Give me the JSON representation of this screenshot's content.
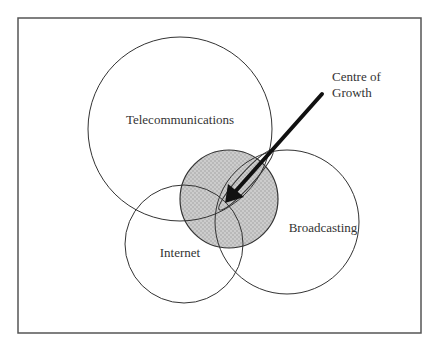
{
  "diagram": {
    "type": "venn",
    "frame": {
      "x": 18,
      "y": 18,
      "width": 403,
      "height": 315,
      "stroke": "#555555"
    },
    "circles": [
      {
        "id": "telecommunications",
        "label": "Telecommunications",
        "cx": 180,
        "cy": 129,
        "r": 92,
        "label_x": 180,
        "label_y": 124
      },
      {
        "id": "internet",
        "label": "Internet",
        "cx": 184,
        "cy": 244,
        "r": 59,
        "label_x": 180,
        "label_y": 257
      },
      {
        "id": "broadcasting",
        "label": "Broadcasting",
        "cx": 287,
        "cy": 222,
        "r": 72,
        "label_x": 323,
        "label_y": 232
      }
    ],
    "centre": {
      "cx": 229,
      "cy": 199,
      "r": 49,
      "fill": "#b9b9b9",
      "dot": "#d6d6d6"
    },
    "annotation": {
      "line1": "Centre of",
      "line2": "Growth",
      "x": 332,
      "y1": 81,
      "y2": 97,
      "arrow": {
        "x1": 322,
        "y1": 94,
        "x2": 225,
        "y2": 203
      }
    }
  }
}
